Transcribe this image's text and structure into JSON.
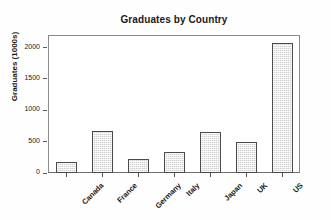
{
  "chart_data": {
    "type": "bar",
    "title": "Graduates by Country",
    "xlabel": "",
    "ylabel": "Graduates (1000s)",
    "categories": [
      "Canada",
      "France",
      "Germany",
      "Italy",
      "Japan",
      "UK",
      "US"
    ],
    "values": [
      175,
      670,
      225,
      340,
      650,
      490,
      2080
    ],
    "ylim": [
      0,
      2200
    ],
    "yticks": [
      0,
      500,
      1000,
      1500,
      2000
    ],
    "ytick_labels": [
      "0",
      "500",
      "1000",
      "1500",
      "2000"
    ],
    "grid": false,
    "legend": false,
    "bar_fill_color": "#cfcfcf",
    "bar_edge_color": "#4a4a4a",
    "frame_color": "#8a8a8a",
    "background_color": "#ffffff",
    "text_color": "#1a1a1a"
  }
}
